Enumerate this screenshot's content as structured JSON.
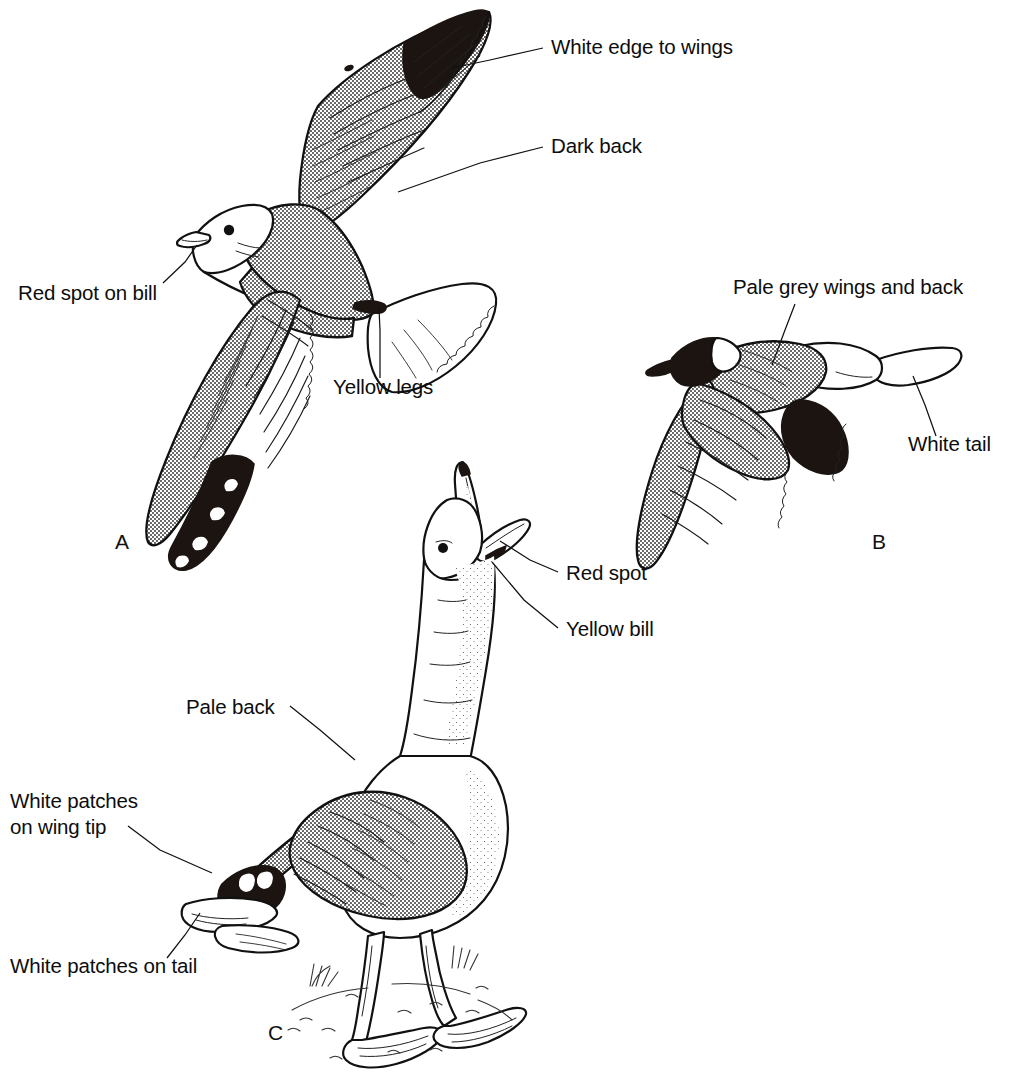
{
  "figure": {
    "background_color": "#ffffff",
    "ink_color": "#111111",
    "panels": [
      {
        "id": "A",
        "letter": "A",
        "subject": "large gull in flight, seen from above",
        "letter_position": {
          "x": 115,
          "y": 549
        }
      },
      {
        "id": "B",
        "letter": "B",
        "subject": "small hooded gull in flight",
        "letter_position": {
          "x": 872,
          "y": 549
        }
      },
      {
        "id": "C",
        "letter": "C",
        "subject": "gull standing on ground, calling with open bill",
        "letter_position": {
          "x": 268,
          "y": 1040
        }
      }
    ],
    "labels": [
      {
        "id": "white-edge-to-wings",
        "text": "White edge to wings",
        "panel": "A",
        "text_x": 551,
        "text_y": 54,
        "anchor": "start",
        "leader": [
          [
            543,
            48
          ],
          [
            490,
            60
          ],
          [
            452,
            68
          ]
        ]
      },
      {
        "id": "dark-back",
        "text": "Dark back",
        "panel": "A",
        "text_x": 551,
        "text_y": 153,
        "anchor": "start",
        "leader": [
          [
            543,
            147
          ],
          [
            480,
            163
          ],
          [
            398,
            192
          ]
        ]
      },
      {
        "id": "red-spot-on-bill",
        "text": "Red spot on bill",
        "panel": "A",
        "text_x": 18,
        "text_y": 300,
        "anchor": "start",
        "leader": [
          [
            163,
            283
          ],
          [
            185,
            262
          ],
          [
            197,
            245
          ]
        ]
      },
      {
        "id": "yellow-legs",
        "text": "Yellow legs",
        "panel": "A",
        "text_x": 333,
        "text_y": 394,
        "anchor": "start",
        "leader": [
          [
            380,
            378
          ],
          [
            380,
            330
          ],
          [
            379,
            309
          ]
        ]
      },
      {
        "id": "pale-grey-wings-and-back",
        "text": "Pale grey wings and back",
        "panel": "B",
        "text_x": 733,
        "text_y": 294,
        "anchor": "start",
        "leader": [
          [
            795,
            304
          ],
          [
            785,
            330
          ],
          [
            772,
            365
          ]
        ]
      },
      {
        "id": "white-tail",
        "text": "White tail",
        "panel": "B",
        "text_x": 908,
        "text_y": 451,
        "anchor": "start",
        "leader": [
          [
            936,
            436
          ],
          [
            925,
            405
          ],
          [
            913,
            376
          ]
        ]
      },
      {
        "id": "red-spot",
        "text": "Red spot",
        "panel": "C",
        "text_x": 566,
        "text_y": 580,
        "anchor": "start",
        "leader": [
          [
            558,
            572
          ],
          [
            530,
            560
          ],
          [
            500,
            541
          ]
        ]
      },
      {
        "id": "yellow-bill",
        "text": "Yellow bill",
        "panel": "C",
        "text_x": 566,
        "text_y": 636,
        "anchor": "start",
        "leader": [
          [
            558,
            628
          ],
          [
            524,
            600
          ],
          [
            492,
            562
          ]
        ]
      },
      {
        "id": "pale-back",
        "text": "Pale back",
        "panel": "C",
        "text_x": 186,
        "text_y": 714,
        "anchor": "start",
        "leader": [
          [
            290,
            706
          ],
          [
            320,
            730
          ],
          [
            355,
            760
          ]
        ]
      },
      {
        "id": "white-patches-on-wing-tip",
        "text": "White patches\non wing tip",
        "text_line_1": "White patches",
        "text_line_2": "on wing tip",
        "panel": "C",
        "text_x": 10,
        "text_y": 808,
        "anchor": "start",
        "leader": [
          [
            128,
            826
          ],
          [
            160,
            850
          ],
          [
            212,
            873
          ]
        ]
      },
      {
        "id": "white-patches-on-tail",
        "text": "White patches on tail",
        "panel": "C",
        "text_x": 10,
        "text_y": 973,
        "anchor": "start",
        "leader": [
          [
            167,
            958
          ],
          [
            185,
            935
          ],
          [
            200,
            913
          ]
        ]
      }
    ]
  }
}
